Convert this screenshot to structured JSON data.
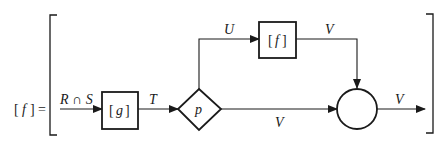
{
  "equation": {
    "lhs_open": "[",
    "lhs_fn": "f",
    "lhs_close": "]",
    "equals": "="
  },
  "nodes": {
    "g_box": {
      "label": "g",
      "open": "[",
      "close": "]"
    },
    "f_box": {
      "label": "f",
      "open": "[",
      "close": "]"
    },
    "predicate": {
      "label": "p"
    },
    "join": {
      "label": ""
    }
  },
  "edges": {
    "input": "R ∩ S",
    "g_to_p": "T",
    "p_to_f": "U",
    "f_to_join": "V",
    "p_to_join": "V",
    "output": "V"
  },
  "colors": {
    "stroke": "#1a1a1a",
    "background": "#ffffff"
  }
}
